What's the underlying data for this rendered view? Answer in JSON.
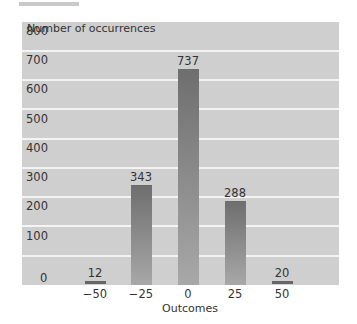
{
  "chart_data": {
    "type": "bar",
    "title": "",
    "xlabel": "Outcomes",
    "ylabel": "Number of occurrences",
    "categories": [
      "-50",
      "-25",
      "0",
      "25",
      "50"
    ],
    "values": [
      12,
      343,
      737,
      288,
      20
    ],
    "ylim": [
      0,
      800
    ],
    "yticks": [
      "0",
      "100",
      "200",
      "300",
      "400",
      "500",
      "600",
      "700",
      "800"
    ],
    "grid": true,
    "legend": null,
    "data_labels": [
      "12",
      "343",
      "737",
      "288",
      "20"
    ]
  },
  "colors": {
    "panel": "#cfcfcf",
    "bar": "#7a7a7a",
    "grid": "#f4f4f4"
  }
}
